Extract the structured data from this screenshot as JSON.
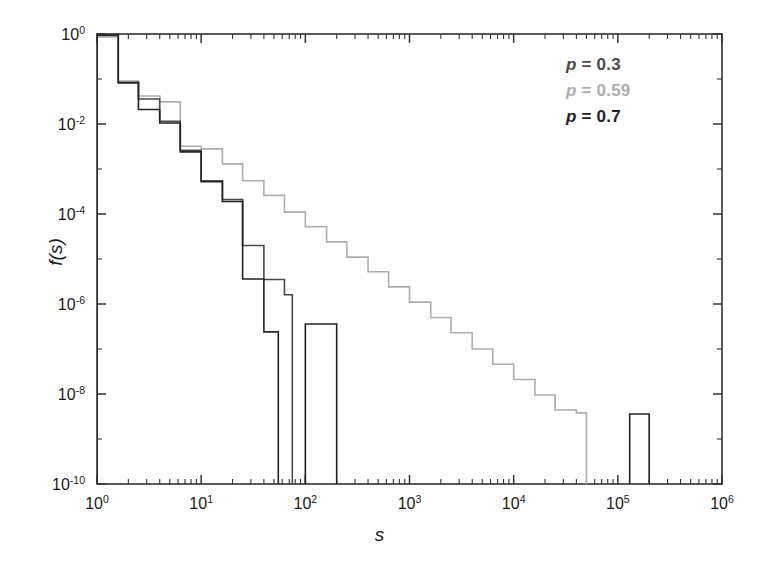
{
  "figure": {
    "width": 759,
    "height": 569,
    "background": "#ffffff"
  },
  "axes": {
    "x_label": "s",
    "y_label": "f(s)",
    "x_tick_labels": [
      "10",
      "10",
      "10",
      "10",
      "10",
      "10",
      "10"
    ],
    "x_tick_exponents": [
      "0",
      "1",
      "2",
      "3",
      "4",
      "5",
      "6"
    ],
    "y_tick_labels": [
      "10",
      "10",
      "10",
      "10",
      "10",
      "10"
    ],
    "y_tick_exponents": [
      "0",
      "-2",
      "-4",
      "-6",
      "-8",
      "-10"
    ]
  },
  "legend": {
    "position": "top-right",
    "items": [
      {
        "name": "p = 0.3",
        "label": "p",
        "eq": " = ",
        "value": "0.3",
        "color": "#4a4a4a"
      },
      {
        "name": "p = 0.59",
        "label": "p",
        "eq": " = ",
        "value": "0.59",
        "color": "#aeaeae"
      },
      {
        "name": "p = 0.7",
        "label": "p",
        "eq": " = ",
        "value": "0.7",
        "color": "#232323"
      }
    ]
  },
  "chart_data": {
    "type": "line",
    "subtype": "step-histogram",
    "title": "",
    "xlabel": "s",
    "ylabel": "f(s)",
    "xscale": "log",
    "yscale": "log",
    "xlim": [
      1,
      1000000
    ],
    "ylim": [
      1e-10,
      1
    ],
    "grid": false,
    "legend_position": "top-right",
    "xticks": [
      1,
      10,
      100,
      1000,
      10000,
      100000,
      1000000
    ],
    "yticks": [
      1,
      0.01,
      0.0001,
      1e-06,
      1e-08,
      1e-10
    ],
    "series": [
      {
        "name": "p = 0.3",
        "color": "#4a4a4a",
        "line_width": 1.6,
        "comment": "subcritical: avalanche sizes cut off rapidly near s~60",
        "bin_edges": [
          1,
          1.6,
          2.5,
          4,
          6.3,
          10,
          16,
          25,
          40,
          63,
          75
        ],
        "values": [
          0.93,
          0.085,
          0.036,
          0.0115,
          0.0026,
          0.00055,
          0.00021,
          2e-05,
          3.5e-06,
          1.6e-06
        ]
      },
      {
        "name": "p = 0.59",
        "color": "#aeaeae",
        "line_width": 1.6,
        "comment": "critical: power-law tail extending to s~5e4",
        "bin_edges": [
          1,
          1.6,
          2.5,
          4,
          6.3,
          10,
          16,
          25,
          40,
          63,
          100,
          160,
          250,
          400,
          630,
          1000,
          1600,
          2500,
          4000,
          6300,
          10000,
          16000,
          25000,
          40000,
          50000
        ],
        "values": [
          0.86,
          0.09,
          0.042,
          0.031,
          0.0032,
          0.0028,
          0.0013,
          0.00055,
          0.00026,
          0.00011,
          5.2e-05,
          2.4e-05,
          1.1e-05,
          5.2e-06,
          2.4e-06,
          1.1e-06,
          5e-07,
          2.3e-07,
          1e-07,
          4.6e-08,
          2.1e-08,
          9.5e-09,
          4.4e-09,
          3.8e-09
        ]
      },
      {
        "name": "p = 0.7",
        "color": "#232323",
        "line_width": 1.6,
        "comment": "supercritical: bulk cuts off near s~55 with isolated system-spanning spikes",
        "bin_edges": [
          1,
          1.6,
          2.5,
          4,
          6.3,
          10,
          16,
          25,
          40,
          55
        ],
        "values": [
          0.95,
          0.082,
          0.021,
          0.0105,
          0.0024,
          0.00052,
          0.00019,
          3.6e-06,
          2.4e-07
        ]
      }
    ],
    "isolated_spikes": [
      {
        "series": "p = 0.7",
        "x_start": 100,
        "x_end": 200,
        "value": 3.6e-07,
        "color": "#232323"
      },
      {
        "series": "p = 0.7",
        "x_start": 130000,
        "x_end": 200000,
        "value": 3.6e-09,
        "color": "#232323"
      }
    ]
  }
}
